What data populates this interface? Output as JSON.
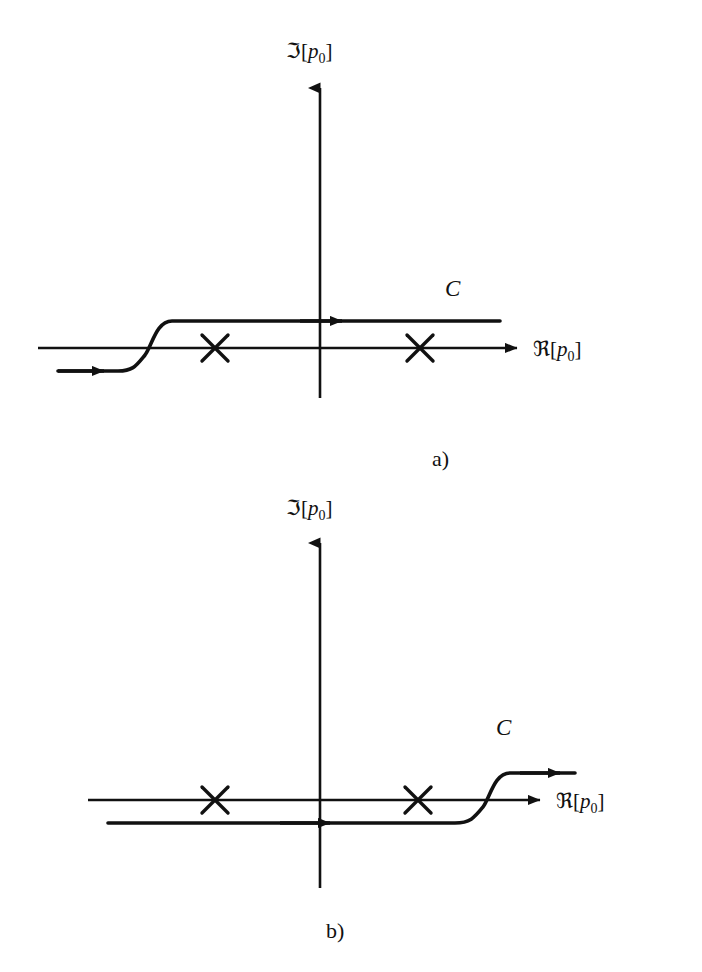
{
  "figure": {
    "type": "contour-integration-diagram",
    "ink_color": "#111111",
    "background_color": "#ffffff"
  },
  "axes": {
    "imaginary_label": "ℑ[p₀]",
    "imaginary_symbol": "ℑ",
    "imaginary_bracket_open": "[",
    "imaginary_variable": "p",
    "imaginary_subscript": "0",
    "imaginary_bracket_close": "]",
    "real_label": "ℜ[p₀]",
    "real_symbol": "ℜ",
    "real_bracket_open": "[",
    "real_variable": "p",
    "real_subscript": "0",
    "real_bracket_close": "]"
  },
  "panels": [
    {
      "id": "a",
      "label": "a)",
      "contour_label": "C",
      "poles": [
        {
          "name": "pole-left",
          "marker": "×",
          "x": 215,
          "y": 348
        },
        {
          "name": "pole-right",
          "marker": "×",
          "x": 420,
          "y": 348
        }
      ],
      "contour_direction": "left-to-right",
      "contour_start_side": "below-axis",
      "contour_end_side": "above-axis",
      "arrow_count": 2
    },
    {
      "id": "b",
      "label": "b)",
      "contour_label": "C",
      "poles": [
        {
          "name": "pole-left",
          "marker": "×",
          "x": 215,
          "y": 800
        },
        {
          "name": "pole-right",
          "marker": "×",
          "x": 418,
          "y": 800
        }
      ],
      "contour_direction": "left-to-right",
      "contour_start_side": "below-axis",
      "contour_end_side": "above-axis",
      "arrow_count": 2
    }
  ]
}
